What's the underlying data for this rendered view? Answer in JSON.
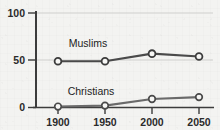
{
  "chart_data": {
    "type": "line",
    "title": "",
    "subtitle": "",
    "xlabel": "",
    "ylabel": "",
    "x": [
      1900,
      1950,
      2000,
      2050
    ],
    "categories": [
      "1900",
      "1950",
      "2000",
      "2050"
    ],
    "series": [
      {
        "name": "Muslims",
        "values": [
          49,
          49,
          57,
          54
        ],
        "label_x": 1930,
        "label_y": 66,
        "color": "#4a4a4a"
      },
      {
        "name": "Christians",
        "values": [
          1,
          2,
          9,
          11
        ],
        "label_x": 1932,
        "label_y": 22,
        "color": "#6a6a6a"
      }
    ],
    "xlim": [
      1890,
      2062
    ],
    "ylim": [
      0,
      100
    ],
    "yticks": [
      0,
      50,
      100
    ],
    "ytick_labels": [
      "0",
      "50",
      "100"
    ],
    "xticks": [
      1900,
      1950,
      2000,
      2050
    ],
    "xtick_labels": [
      "1900",
      "1950",
      "2000",
      "2050"
    ],
    "grid": true,
    "gridlines_at": [
      50,
      100
    ],
    "legend": "inline-series-labels",
    "marker": "open-circle"
  },
  "style": {
    "background": "#f3f3f1",
    "axis_color": "#3c3c3c",
    "grid_color": "#c9c9c7",
    "text_color": "#2b2b2b",
    "marker_fill": "#f7f7f5"
  }
}
